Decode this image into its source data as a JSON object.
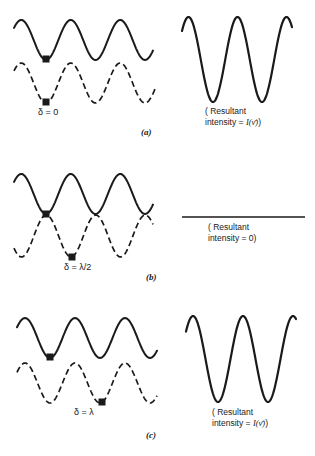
{
  "colors": {
    "ink": "#1a1a1a",
    "background": "#ffffff"
  },
  "panels": [
    {
      "id": "a",
      "tag": "(a)",
      "delta_label": "δ = 0",
      "result_line1": "( Resultant",
      "result_line2_prefix": "intensity  =  ",
      "result_line2_expr": "I(ν̄)",
      "result_line2_suffix": ")",
      "solid_wave": {
        "x0": 14,
        "x1": 153,
        "y_mid": 40,
        "amp": 20,
        "period": 49.5,
        "phase_trough_x": 46
      },
      "dashed_wave": {
        "x0": 14,
        "x1": 155,
        "y_mid": 83,
        "amp": 20,
        "period": 49.5,
        "phase_trough_x": 46
      },
      "markers": [
        {
          "x": 46,
          "y": 59
        },
        {
          "x": 46,
          "y": 102
        }
      ],
      "resultant": {
        "type": "cos",
        "x0": 182,
        "x1": 292,
        "y_top": 17,
        "y_bottom": 102,
        "trough_xs": [
          213,
          262
        ]
      },
      "delta_pos": {
        "x": 38,
        "y": 112
      },
      "tag_pos": {
        "x": 142,
        "y": 132
      },
      "result_pos": {
        "x": 206,
        "y": 107
      }
    },
    {
      "id": "b",
      "tag": "(b)",
      "delta_label": "δ = λ/2",
      "result_line1": "( Resultant",
      "result_line2_prefix": "intensity  =  0)",
      "result_line2_expr": "",
      "result_line2_suffix": "",
      "solid_wave": {
        "x0": 14,
        "x1": 153,
        "y_mid": 194,
        "amp": 20,
        "period": 49.5,
        "phase_trough_x": 46
      },
      "dashed_wave": {
        "x0": 14,
        "x1": 153,
        "y_mid": 236,
        "amp": 21,
        "period": 49.5,
        "phase_trough_x": 71
      },
      "markers": [
        {
          "x": 46,
          "y": 214
        },
        {
          "x": 72,
          "y": 257
        }
      ],
      "resultant": {
        "type": "flat",
        "x0": 182,
        "x1": 305,
        "y": 217
      },
      "delta_pos": {
        "x": 63,
        "y": 266
      },
      "tag_pos": {
        "x": 148,
        "y": 276
      },
      "result_pos": {
        "x": 208,
        "y": 222
      }
    },
    {
      "id": "c",
      "tag": "(c)",
      "delta_label": "δ = λ",
      "result_line1": "( Resultant",
      "result_line2_prefix": "intensity  =  ",
      "result_line2_expr": "I(ν̄)",
      "result_line2_suffix": ")",
      "solid_wave": {
        "x0": 17,
        "x1": 157,
        "y_mid": 338,
        "amp": 20,
        "period": 50,
        "phase_trough_x": 50
      },
      "dashed_wave": {
        "x0": 17,
        "x1": 157,
        "y_mid": 383,
        "amp": 20,
        "period": 50,
        "phase_trough_x": 100
      },
      "markers": [
        {
          "x": 50,
          "y": 357
        },
        {
          "x": 102,
          "y": 402
        }
      ],
      "resultant": {
        "type": "cos",
        "x0": 186,
        "x1": 296,
        "y_top": 316,
        "y_bottom": 402,
        "trough_xs": [
          218,
          268
        ]
      },
      "delta_pos": {
        "x": 75,
        "y": 410
      },
      "tag_pos": {
        "x": 147,
        "y": 434
      },
      "result_pos": {
        "x": 213,
        "y": 408
      }
    }
  ]
}
